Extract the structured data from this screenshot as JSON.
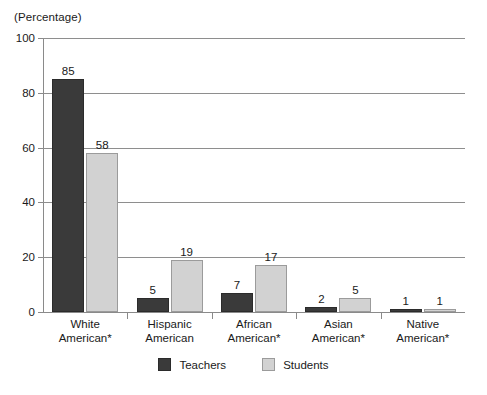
{
  "chart_data": {
    "type": "bar",
    "title": "",
    "unit_label": "(Percentage)",
    "xlabel": "",
    "ylabel": "",
    "ylim": [
      0,
      100
    ],
    "ytick_values": [
      100,
      80,
      60,
      40,
      20,
      0
    ],
    "ytick_labels": [
      "100",
      "80",
      "60",
      "40",
      "20",
      "0"
    ],
    "grid": true,
    "grid_axis": "y",
    "legend_position": "bottom-center",
    "categories": [
      "White\nAmerican*",
      "Hispanic\nAmerican",
      "African\nAmerican*",
      "Asian\nAmerican*",
      "Native\nAmerican*"
    ],
    "category_lines": [
      [
        "White",
        "American*"
      ],
      [
        "Hispanic",
        "American"
      ],
      [
        "African",
        "American*"
      ],
      [
        "Asian",
        "American*"
      ],
      [
        "Native",
        "American*"
      ]
    ],
    "series": [
      {
        "name": "Teachers",
        "color": "#3a3a3a",
        "values": [
          85,
          5,
          7,
          2,
          1
        ],
        "labels": [
          "85",
          "5",
          "7",
          "2",
          "1"
        ]
      },
      {
        "name": "Students",
        "color": "#d2d2d2",
        "values": [
          58,
          19,
          17,
          5,
          1
        ],
        "labels": [
          "58",
          "19",
          "17",
          "5",
          "1"
        ]
      }
    ]
  },
  "legend": {
    "entries": [
      {
        "label": "Teachers"
      },
      {
        "label": "Students"
      }
    ]
  },
  "colors": {
    "teachers": "#3a3a3a",
    "students": "#d2d2d2",
    "axis": "#8a8a8a",
    "grid": "#8e8e8e",
    "text": "#1a1a1a",
    "background": "#ffffff"
  }
}
